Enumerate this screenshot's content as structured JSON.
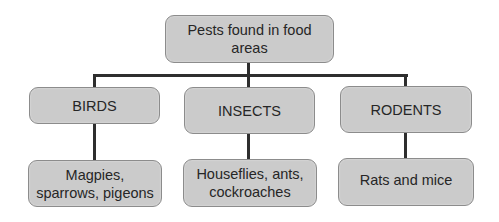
{
  "diagram": {
    "type": "tree",
    "root": {
      "label": "Pests found in food areas",
      "line1": "Pests found in food",
      "line2": "areas"
    },
    "categories": [
      {
        "label": "BIRDS",
        "examples": {
          "label": "Magpies, sparrows, pigeons",
          "line1": "Magpies,",
          "line2": "sparrows, pigeons"
        }
      },
      {
        "label": "INSECTS",
        "examples": {
          "label": "Houseflies, ants, cockroaches",
          "line1": "Houseflies, ants,",
          "line2": "cockroaches"
        }
      },
      {
        "label": "RODENTS",
        "examples": {
          "label": "Rats and mice",
          "line1": "Rats and mice",
          "line2": ""
        }
      }
    ],
    "colors": {
      "box_fill": "#cbcbcb",
      "box_border": "#8c8c8c",
      "text": "#262626",
      "connector": "#2e2e2e"
    }
  }
}
